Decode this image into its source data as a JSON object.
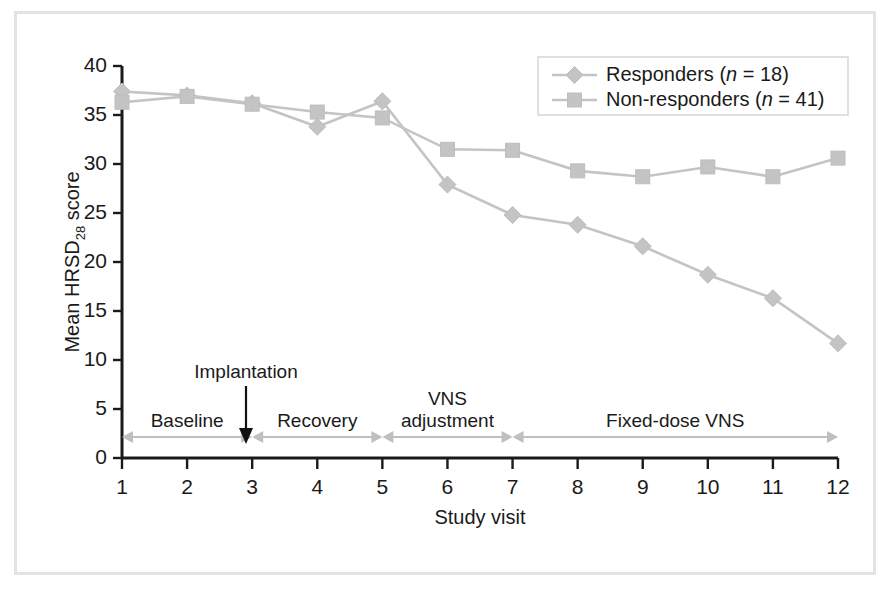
{
  "chart_data": {
    "type": "line",
    "title": "",
    "xlabel": "Study visit",
    "ylabel": "Mean HRSD28 score",
    "ylabel_main": "Mean HRSD",
    "ylabel_sub": "28",
    "ylabel_tail": " score",
    "x": [
      1,
      2,
      3,
      4,
      5,
      6,
      7,
      8,
      9,
      10,
      11,
      12
    ],
    "xtick_labels": [
      "1",
      "2",
      "3",
      "4",
      "5",
      "6",
      "7",
      "8",
      "9",
      "10",
      "11",
      "12"
    ],
    "ytick_labels": [
      "0",
      "5",
      "10",
      "15",
      "20",
      "25",
      "30",
      "35",
      "40"
    ],
    "ytick_values": [
      0,
      5,
      10,
      15,
      20,
      25,
      30,
      35,
      40
    ],
    "ylim": [
      0,
      40
    ],
    "xlim": [
      1,
      12
    ],
    "grid": false,
    "legend_position": "top-right",
    "series": [
      {
        "name": "Responders (n = 18)",
        "label_main": "Responders (",
        "label_italic": "n",
        "label_tail": " = 18)",
        "marker": "diamond",
        "color": "#c4c4c4",
        "values": [
          37.4,
          37.0,
          36.2,
          33.8,
          36.4,
          27.9,
          24.8,
          23.8,
          21.6,
          18.7,
          16.3,
          11.7
        ]
      },
      {
        "name": "Non-responders (n = 41)",
        "label_main": "Non-responders (",
        "label_italic": "n",
        "label_tail": " = 41)",
        "marker": "square",
        "color": "#c4c4c4",
        "values": [
          36.3,
          36.9,
          36.1,
          35.3,
          34.7,
          31.5,
          31.4,
          29.3,
          28.7,
          29.7,
          28.7,
          30.6
        ]
      }
    ],
    "annotations": [
      {
        "name": "implantation",
        "label": "Implantation",
        "at_visit": 3
      },
      {
        "name": "phase-baseline",
        "label": "Baseline",
        "from_visit": 1,
        "to_visit": 3
      },
      {
        "name": "phase-recovery",
        "label": "Recovery",
        "from_visit": 3,
        "to_visit": 5
      },
      {
        "name": "phase-vns-adjustment",
        "label": "VNS\nadjustment",
        "label_line1": "VNS",
        "label_line2": "adjustment",
        "from_visit": 5,
        "to_visit": 7
      },
      {
        "name": "phase-fixed-dose-vns",
        "label": "Fixed-dose VNS",
        "from_visit": 7,
        "to_visit": 12
      }
    ],
    "colors": {
      "series": "#c4c4c4",
      "axis": "#1a1a1a",
      "phase_bar": "#bfbfbf",
      "frame": "#e3e3e3"
    }
  }
}
